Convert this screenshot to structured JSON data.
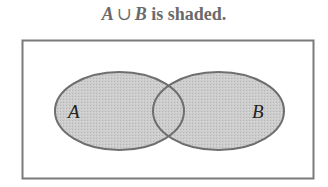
{
  "title": {
    "set_a": "A",
    "operator": "∪",
    "set_b": "B",
    "rest": " is shaded."
  },
  "diagram": {
    "type": "venn",
    "universe": {
      "x": 22,
      "y": 40,
      "width": 292,
      "height": 139
    },
    "sets": [
      {
        "label": "A",
        "cx": 119.5,
        "cy": 111,
        "rx": 64.5,
        "ry": 39
      },
      {
        "label": "B",
        "cx": 218.5,
        "cy": 111,
        "rx": 65.5,
        "ry": 39
      }
    ],
    "shaded_region": "A ∪ B",
    "colors": {
      "fill": "#c8c8c8",
      "stroke": "#707070",
      "border": "#7a7a7a"
    }
  }
}
